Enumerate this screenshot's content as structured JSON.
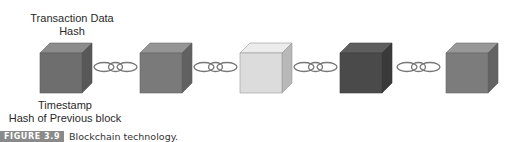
{
  "labels": {
    "top_line1": "Transaction Data",
    "top_line2": "Hash",
    "bottom_line1": "Timestamp",
    "bottom_line2": "Hash of Previous block"
  },
  "caption": {
    "figure_number": "FIGURE 3.9",
    "text": "Blockchain technology."
  },
  "blocks": [
    {
      "name": "block-1",
      "front": "#6e6e6e",
      "top": "#8c8c8c",
      "side": "#585858"
    },
    {
      "name": "block-2",
      "front": "#7a7a7a",
      "top": "#959595",
      "side": "#616161"
    },
    {
      "name": "block-3",
      "front": "#dcdcdc",
      "top": "#ececec",
      "side": "#b8b8b8"
    },
    {
      "name": "block-4",
      "front": "#4a4a4a",
      "top": "#5e5e5e",
      "side": "#3a3a3a"
    },
    {
      "name": "block-5",
      "front": "#7c7c7c",
      "top": "#989898",
      "side": "#636363"
    }
  ],
  "chain_links": 4
}
